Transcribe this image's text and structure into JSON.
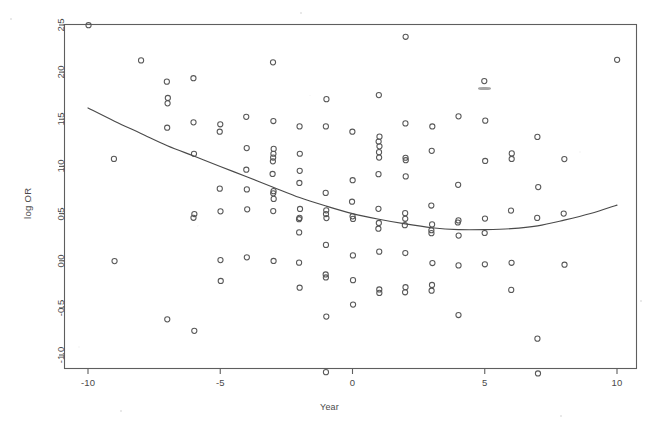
{
  "figure": {
    "kind": "scatter-plot-with-fitted-curve",
    "background": "#ffffff",
    "frame_color": "#5a5a5a",
    "point_color": "#555555",
    "curve_color": "#4a4a4a"
  },
  "chart_data": {
    "type": "scatter",
    "title": "",
    "subtitle": "",
    "xlabel": "Year",
    "ylabel": "log OR",
    "xlim": [
      -11.0,
      11.0
    ],
    "ylim": [
      -1.35,
      2.55
    ],
    "grid": false,
    "legend": null,
    "xticks": [
      -10,
      -5,
      0,
      5,
      10
    ],
    "xtick_labels": [
      "-10",
      "-5",
      "0",
      "5",
      "10"
    ],
    "yticks": [
      -1.0,
      -0.5,
      0.0,
      0.5,
      1.0,
      1.5,
      2.0,
      2.5
    ],
    "ytick_labels": [
      "-1.0",
      "-0.5",
      "0.0",
      "0.5",
      "1.0",
      "1.5",
      "2.0",
      "2.5"
    ],
    "marker": "open-circle",
    "marker_size_px": 5,
    "points": [
      [
        -10.0,
        2.5
      ],
      [
        -9.0,
        1.08
      ],
      [
        -9.0,
        0.0
      ],
      [
        -8.0,
        2.13
      ],
      [
        -7.0,
        1.9
      ],
      [
        -7.0,
        1.72
      ],
      [
        -7.0,
        1.67
      ],
      [
        -7.0,
        1.41
      ],
      [
        -7.0,
        -0.62
      ],
      [
        -6.0,
        1.93
      ],
      [
        -6.0,
        1.47
      ],
      [
        -6.0,
        1.13
      ],
      [
        -6.0,
        0.49
      ],
      [
        -6.0,
        0.46
      ],
      [
        -6.0,
        -0.75
      ],
      [
        -5.0,
        1.45
      ],
      [
        -5.0,
        1.37
      ],
      [
        -5.0,
        0.76
      ],
      [
        -5.0,
        0.52
      ],
      [
        -5.0,
        0.0
      ],
      [
        -5.0,
        -0.22
      ],
      [
        -4.0,
        1.53
      ],
      [
        -4.0,
        1.19
      ],
      [
        -4.0,
        0.97
      ],
      [
        -4.0,
        0.75
      ],
      [
        -4.0,
        0.55
      ],
      [
        -4.0,
        0.03
      ],
      [
        -3.0,
        2.1
      ],
      [
        -3.0,
        1.48
      ],
      [
        -3.0,
        1.18
      ],
      [
        -3.0,
        1.13
      ],
      [
        -3.0,
        1.1
      ],
      [
        -3.0,
        1.06
      ],
      [
        -3.0,
        0.92
      ],
      [
        -3.0,
        0.74
      ],
      [
        -3.0,
        0.71
      ],
      [
        -3.0,
        0.66
      ],
      [
        -3.0,
        0.52
      ],
      [
        -3.0,
        0.0
      ],
      [
        -2.0,
        1.43
      ],
      [
        -2.0,
        1.13
      ],
      [
        -2.0,
        0.95
      ],
      [
        -2.0,
        0.82
      ],
      [
        -2.0,
        0.55
      ],
      [
        -2.0,
        0.46
      ],
      [
        -2.0,
        0.44
      ],
      [
        -2.0,
        0.3
      ],
      [
        -2.0,
        -0.02
      ],
      [
        -2.0,
        -0.28
      ],
      [
        -1.0,
        1.71
      ],
      [
        -1.0,
        1.42
      ],
      [
        -1.0,
        0.72
      ],
      [
        -1.0,
        0.53
      ],
      [
        -1.0,
        0.49
      ],
      [
        -1.0,
        0.45
      ],
      [
        -1.0,
        0.17
      ],
      [
        -1.0,
        -0.15
      ],
      [
        -1.0,
        -0.18
      ],
      [
        -1.0,
        -0.59
      ],
      [
        -1.0,
        -1.18
      ],
      [
        0.0,
        1.37
      ],
      [
        0.0,
        0.85
      ],
      [
        0.0,
        0.62
      ],
      [
        0.0,
        0.47
      ],
      [
        0.0,
        0.44
      ],
      [
        0.0,
        0.06
      ],
      [
        0.0,
        -0.21
      ],
      [
        0.0,
        -0.47
      ],
      [
        1.0,
        1.76
      ],
      [
        1.0,
        1.32
      ],
      [
        1.0,
        1.26
      ],
      [
        1.0,
        1.21
      ],
      [
        1.0,
        1.15
      ],
      [
        1.0,
        1.1
      ],
      [
        1.0,
        0.92
      ],
      [
        1.0,
        0.55
      ],
      [
        1.0,
        0.4
      ],
      [
        1.0,
        0.34
      ],
      [
        1.0,
        0.1
      ],
      [
        1.0,
        -0.3
      ],
      [
        1.0,
        -0.34
      ],
      [
        2.0,
        2.37
      ],
      [
        2.0,
        1.45
      ],
      [
        2.0,
        1.09
      ],
      [
        2.0,
        1.07
      ],
      [
        2.0,
        0.89
      ],
      [
        2.0,
        0.5
      ],
      [
        2.0,
        0.44
      ],
      [
        2.0,
        0.38
      ],
      [
        2.0,
        0.08
      ],
      [
        2.0,
        -0.28
      ],
      [
        2.0,
        -0.33
      ],
      [
        3.0,
        1.43
      ],
      [
        3.0,
        1.16
      ],
      [
        3.0,
        0.58
      ],
      [
        3.0,
        0.39
      ],
      [
        3.0,
        0.32
      ],
      [
        3.0,
        0.29
      ],
      [
        3.0,
        -0.02
      ],
      [
        3.0,
        -0.26
      ],
      [
        3.0,
        -0.32
      ],
      [
        4.0,
        1.53
      ],
      [
        4.0,
        0.8
      ],
      [
        4.0,
        0.43
      ],
      [
        4.0,
        0.4
      ],
      [
        4.0,
        0.27
      ],
      [
        4.0,
        -0.05
      ],
      [
        4.0,
        -0.58
      ],
      [
        5.0,
        1.91
      ],
      [
        5.0,
        1.48
      ],
      [
        5.0,
        1.06
      ],
      [
        5.0,
        0.45
      ],
      [
        5.0,
        0.29
      ],
      [
        5.0,
        -0.04
      ],
      [
        6.0,
        1.14
      ],
      [
        6.0,
        1.08
      ],
      [
        6.0,
        0.53
      ],
      [
        6.0,
        -0.02
      ],
      [
        6.0,
        -0.31
      ],
      [
        7.0,
        1.31
      ],
      [
        7.0,
        0.78
      ],
      [
        7.0,
        0.45
      ],
      [
        7.0,
        -0.83
      ],
      [
        7.0,
        -1.19
      ],
      [
        8.0,
        1.08
      ],
      [
        8.0,
        0.5
      ],
      [
        8.0,
        -0.04
      ],
      [
        10.0,
        2.13
      ]
    ],
    "fit_curve": {
      "label": "fitted-trend",
      "type": "quadratic-smooth",
      "x": [
        -10,
        -9,
        -8,
        -7,
        -6,
        -5,
        -4,
        -3,
        -2,
        -1,
        0,
        1,
        2,
        3,
        4,
        5,
        6,
        7,
        8,
        9,
        10
      ],
      "y": [
        1.62,
        1.48,
        1.35,
        1.22,
        1.11,
        1.0,
        0.89,
        0.78,
        0.67,
        0.58,
        0.5,
        0.44,
        0.39,
        0.35,
        0.33,
        0.33,
        0.34,
        0.37,
        0.43,
        0.5,
        0.59
      ]
    },
    "artifacts": [
      {
        "name": "scan-smudge",
        "x": 5.0,
        "y": 1.83,
        "w_px": 13,
        "h_px": 3
      }
    ]
  }
}
